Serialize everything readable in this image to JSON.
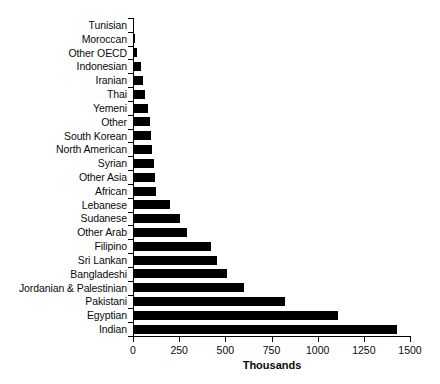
{
  "chart_data": {
    "type": "bar",
    "orientation": "horizontal",
    "title": "",
    "subtitle": "",
    "xlabel": "Thousands",
    "ylabel": "",
    "xlim": [
      0,
      1500
    ],
    "xticks": [
      0,
      250,
      500,
      750,
      1000,
      1250,
      1500
    ],
    "xtick_labels": [
      "0",
      "250",
      "500",
      "750",
      "1000",
      "1250",
      "1500"
    ],
    "grid": false,
    "legend": null,
    "bar_color": "#000000",
    "background_color": "#ffffff",
    "categories": [
      "Tunisian",
      "Moroccan",
      "Other OECD",
      "Indonesian",
      "Iranian",
      "Thai",
      "Yemeni",
      "Other",
      "South Korean",
      "North American",
      "Syrian",
      "Other Asia",
      "African",
      "Lebanese",
      "Sudanese",
      "Other Arab",
      "Filipino",
      "Sri Lankan",
      "Bangladeshi",
      "Jordanian & Palestinian",
      "Pakistani",
      "Egyptian",
      "Indian"
    ],
    "values": [
      5,
      12,
      22,
      42,
      55,
      65,
      80,
      90,
      100,
      105,
      112,
      118,
      122,
      200,
      255,
      290,
      420,
      455,
      510,
      600,
      825,
      1110,
      1430
    ]
  }
}
